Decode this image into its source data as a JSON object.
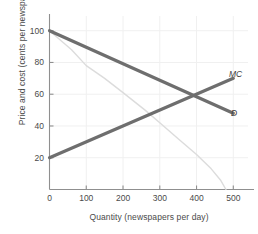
{
  "chart_data": {
    "type": "line",
    "title": "",
    "xlabel": "Quantity (newspapers per day)",
    "ylabel": "Price and cost (cents per newspaper)",
    "xlim": [
      0,
      540
    ],
    "ylim": [
      0,
      108
    ],
    "xticks": [
      0,
      100,
      200,
      300,
      400,
      500
    ],
    "yticks": [
      20,
      40,
      60,
      80,
      100
    ],
    "xtick_labels": [
      "0",
      "100",
      "200",
      "300",
      "400",
      "500"
    ],
    "ytick_labels": [
      "20",
      "40",
      "60",
      "80",
      "100"
    ],
    "grid": "faint-vertical",
    "legend_position": "inline-end-of-line",
    "annotations": [
      {
        "text": "MC",
        "x": 500,
        "y": 70
      },
      {
        "text": "D",
        "x": 500,
        "y": 48
      }
    ],
    "series": [
      {
        "name": "MC",
        "label": "MC",
        "color": "#6e6e6e",
        "width": 3.2,
        "points": [
          [
            0,
            20
          ],
          [
            500,
            70
          ]
        ]
      },
      {
        "name": "D",
        "label": "D",
        "color": "#6e6e6e",
        "width": 3.2,
        "points": [
          [
            0,
            100
          ],
          [
            500,
            48
          ]
        ]
      },
      {
        "name": "MR",
        "label": "",
        "color": "#dcdcdc",
        "width": 1.4,
        "points": [
          [
            0,
            100
          ],
          [
            60,
            88
          ],
          [
            100,
            78
          ],
          [
            150,
            70
          ],
          [
            200,
            61
          ],
          [
            260,
            50
          ],
          [
            300,
            42
          ],
          [
            350,
            32
          ],
          [
            400,
            22
          ],
          [
            440,
            13
          ],
          [
            465,
            6
          ],
          [
            480,
            0
          ]
        ]
      }
    ],
    "intersection": {
      "x": 400,
      "y": 60
    },
    "axis_color": "#8f8f8f",
    "grid_color": "#f0f0f0",
    "text_color": "#4a4a4a"
  },
  "axes": {
    "x_title": "Quantity (newspapers per day)",
    "y_title": "Price and cost (cents per newspaper)"
  },
  "labels": {
    "mc": "MC",
    "d": "D"
  }
}
